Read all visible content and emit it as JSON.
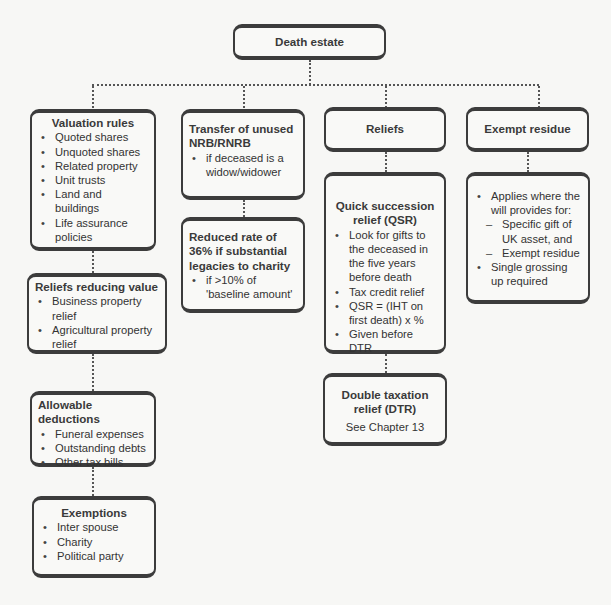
{
  "root": {
    "title": "Death estate"
  },
  "columns": {
    "valuation": {
      "title": "Valuation rules",
      "items": [
        "Quoted shares",
        "Unquoted shares",
        "Related property",
        "Unit trusts",
        "Land and buildings",
        "Life assurance policies"
      ]
    },
    "reliefs_reducing": {
      "title": "Reliefs reducing value",
      "items": [
        "Business property relief",
        "Agricultural property relief"
      ]
    },
    "allowable": {
      "title": "Allowable deductions",
      "items": [
        "Funeral expenses",
        "Outstanding debts",
        "Other tax bills"
      ]
    },
    "exemptions": {
      "title": "Exemptions",
      "items": [
        "Inter spouse",
        "Charity",
        "Political party"
      ]
    },
    "transfer": {
      "title": "Transfer of unused NRB/RNRB",
      "items": [
        "if deceased is a widow/widower"
      ]
    },
    "reduced_rate": {
      "title": "Reduced rate of 36% if substantial legacies to charity",
      "items": [
        "if >10% of 'baseline amount'"
      ]
    },
    "reliefs": {
      "title": "Reliefs"
    },
    "qsr": {
      "title": "Quick succession relief (QSR)",
      "items": [
        "Look for gifts to the deceased in the five years before death",
        "Tax credit relief",
        "QSR = (IHT on first death) x %",
        "Given before DTR"
      ]
    },
    "dtr": {
      "title": "Double taxation relief (DTR)",
      "note": "See Chapter 13"
    },
    "exempt_residue": {
      "title": "Exempt residue"
    },
    "exempt_detail": {
      "item1": "Applies where the will provides for:",
      "subitems": [
        "Specific gift of UK asset, and",
        "Exempt residue"
      ],
      "item2": "Single grossing up required"
    }
  }
}
